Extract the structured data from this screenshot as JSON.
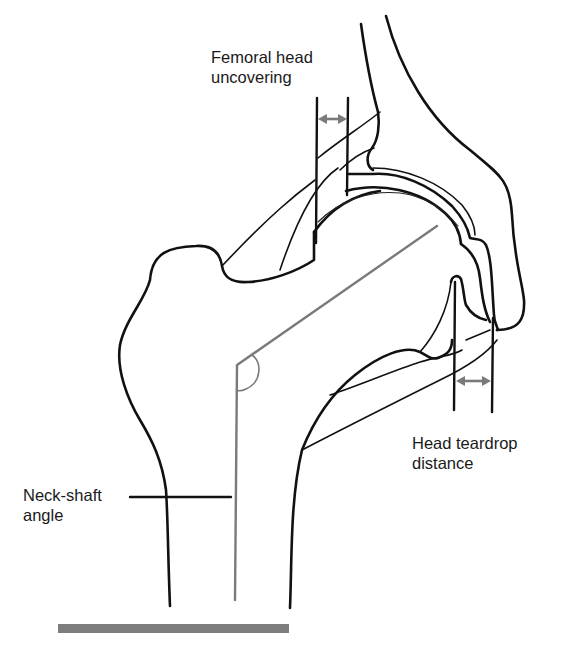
{
  "diagram": {
    "colors": {
      "outline": "#111111",
      "measurement_lines": "#7a7a7a",
      "ground_bar": "#7d7d7d",
      "background": "#ffffff"
    },
    "labels": {
      "femoral_head_uncovering": {
        "line1": "Femoral head",
        "line2": "uncovering"
      },
      "head_teardrop_distance": {
        "line1": "Head teardrop",
        "line2": "distance"
      },
      "neck_shaft_angle": {
        "line1": "Neck-shaft",
        "line2": "angle"
      }
    },
    "measurements": [
      {
        "name": "Femoral head uncovering",
        "type": "horizontal double-arrow between two vertical lines",
        "location": "top, above femoral head"
      },
      {
        "name": "Head teardrop distance",
        "type": "horizontal double-arrow between two vertical lines",
        "location": "right, below acetabular teardrop"
      },
      {
        "name": "Neck-shaft angle",
        "type": "angle between femoral neck axis and shaft axis",
        "location": "left, femoral neck/shaft junction"
      }
    ]
  }
}
